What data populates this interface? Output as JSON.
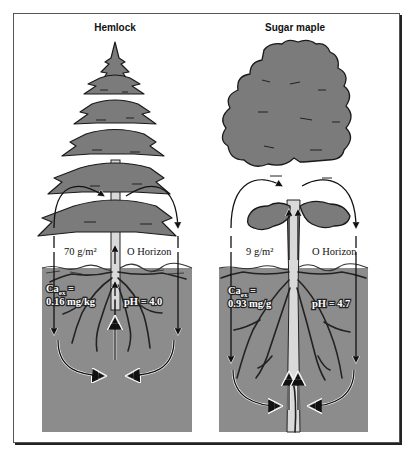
{
  "figure": {
    "colors": {
      "soil": "#8c8c8c",
      "foliage": "#7b7b7b",
      "outline": "#1a1a1a",
      "trunk": "#d6d6d6",
      "frame": "#555555"
    },
    "panels": [
      {
        "id": "hemlock",
        "title": "Hemlock",
        "litter_mass": "70 g/m²",
        "o_horizon_label": "O Horizon",
        "ca_label_prefix": "Ca",
        "ca_label_sub": "ex",
        "ca_label_eq": " =",
        "ca_value": "0.16 mg/kg",
        "ph_label": "pH = 4.0"
      },
      {
        "id": "sugar-maple",
        "title": "Sugar maple",
        "litter_mass": "9 g/m²",
        "o_horizon_label": "O Horizon",
        "ca_label_prefix": "Ca",
        "ca_label_sub": "ex",
        "ca_label_eq": " =",
        "ca_value": "0.93 mg/g",
        "ph_label": "pH = 4.7"
      }
    ]
  }
}
